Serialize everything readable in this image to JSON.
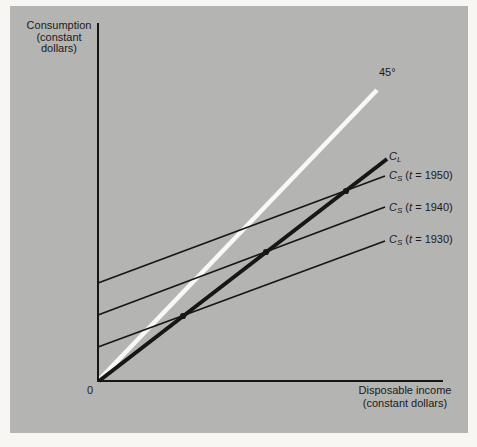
{
  "figure": {
    "panel_bg_color": "#b4b4b2",
    "page_bg_color": "#f7f6f2",
    "black_line_color": "#161616",
    "white_line_color": "#f8f8f5",
    "text_color": "#1b1b1b"
  },
  "labels": {
    "y_axis": "Consumption\n(constant\ndollars)",
    "x_axis": "Disposable income\n(constant dollars)",
    "origin": "0",
    "angle45": "45°"
  },
  "curve_labels": [
    {
      "id": "cl",
      "parts": [
        {
          "t": "C",
          "s": "i"
        },
        {
          "t": "L",
          "s": "sub"
        }
      ]
    },
    {
      "id": "cs1950",
      "parts": [
        {
          "t": "C",
          "s": "i"
        },
        {
          "t": "S",
          "s": "sub"
        },
        {
          "t": " (",
          "s": ""
        },
        {
          "t": "t",
          "s": "i"
        },
        {
          "t": " = 1950)",
          "s": ""
        }
      ]
    },
    {
      "id": "cs1940",
      "parts": [
        {
          "t": "C",
          "s": "i"
        },
        {
          "t": "S",
          "s": "sub"
        },
        {
          "t": " (",
          "s": ""
        },
        {
          "t": "t",
          "s": "i"
        },
        {
          "t": " = 1940)",
          "s": ""
        }
      ]
    },
    {
      "id": "cs1930",
      "parts": [
        {
          "t": "C",
          "s": "i"
        },
        {
          "t": "S",
          "s": "sub"
        },
        {
          "t": " (",
          "s": ""
        },
        {
          "t": "t",
          "s": "i"
        },
        {
          "t": " = 1930)",
          "s": ""
        }
      ]
    }
  ],
  "chart_data": {
    "type": "line",
    "title": "",
    "xlabel": "Disposable income (constant dollars)",
    "ylabel": "Consumption (constant dollars)",
    "axes_numeric": false,
    "grid": false,
    "legend": "labels at right end of each line",
    "x_range_units": [
      0,
      10
    ],
    "y_range_units": [
      0,
      10
    ],
    "series": [
      {
        "name": "45-degree line",
        "label": "45°",
        "equation": "C = Y",
        "x": [
          0,
          8.1
        ],
        "y": [
          0,
          8.1
        ],
        "style": "thick white"
      },
      {
        "name": "Long-run consumption function",
        "label": "C_L",
        "equation": "C ≈ 0.77·Y",
        "x": [
          0,
          8.35
        ],
        "y": [
          0,
          6.2
        ],
        "style": "thick black"
      },
      {
        "name": "Short-run consumption function 1950",
        "label": "C_S (t = 1950)",
        "equation": "C ≈ 2.75 + 0.37·Y",
        "x": [
          0,
          8.3
        ],
        "y": [
          2.75,
          5.75
        ],
        "style": "thin black"
      },
      {
        "name": "Short-run consumption function 1940",
        "label": "C_S (t = 1940)",
        "equation": "C ≈ 1.85 + 0.37·Y",
        "x": [
          0,
          8.3
        ],
        "y": [
          1.85,
          4.85
        ],
        "style": "thin black"
      },
      {
        "name": "Short-run consumption function 1930",
        "label": "C_S (t = 1930)",
        "equation": "C ≈ 0.95 + 0.37·Y",
        "x": [
          0,
          8.3
        ],
        "y": [
          0.95,
          3.9
        ],
        "style": "thin black"
      }
    ],
    "marked_points_units": [
      [
        2.46,
        1.79
      ],
      [
        4.87,
        3.59
      ],
      [
        7.19,
        5.29
      ]
    ],
    "marked_points_note": "dots where C_L crosses each short-run C_S line"
  },
  "geometry": {
    "axes": {
      "points": "98,23 98,381 443,381",
      "width": 2
    },
    "lines": [
      {
        "id": "line-45deg",
        "x1": 99,
        "y1": 380,
        "x2": 377,
        "y2": 90,
        "color": "white",
        "width": 4.6
      },
      {
        "id": "curve-cs-1950",
        "x1": 98,
        "y1": 283,
        "x2": 385,
        "y2": 176,
        "color": "black",
        "width": 1.7
      },
      {
        "id": "curve-cs-1940",
        "x1": 98,
        "y1": 315,
        "x2": 385,
        "y2": 207,
        "color": "black",
        "width": 1.7
      },
      {
        "id": "curve-cs-1930",
        "x1": 98,
        "y1": 347,
        "x2": 385,
        "y2": 241,
        "color": "black",
        "width": 1.7
      },
      {
        "id": "curve-cl",
        "x1": 99,
        "y1": 381,
        "x2": 387,
        "y2": 159,
        "color": "black",
        "width": 4
      }
    ],
    "dots": [
      {
        "cx": 183,
        "cy": 316
      },
      {
        "cx": 266,
        "cy": 252
      },
      {
        "cx": 346,
        "cy": 191
      }
    ],
    "dot_radius": 3.1
  }
}
